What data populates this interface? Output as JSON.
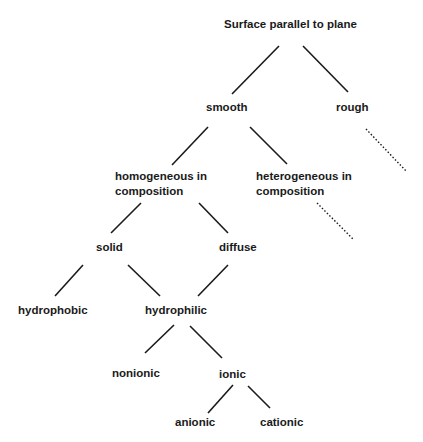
{
  "diagram": {
    "nodes": {
      "root": "Surface parallel to plane",
      "smooth": "smooth",
      "rough": "rough",
      "homogeneous_line1": "homogeneous in",
      "homogeneous_line2": "composition",
      "heterogeneous_line1": "heterogeneous in",
      "heterogeneous_line2": "composition",
      "solid": "solid",
      "diffuse": "diffuse",
      "hydrophobic": "hydrophobic",
      "hydrophilic": "hydrophilic",
      "nonionic": "nonionic",
      "ionic": "ionic",
      "anionic": "anionic",
      "cationic": "cationic"
    },
    "edges": [
      {
        "from": "Surface parallel to plane",
        "to": "smooth",
        "style": "solid"
      },
      {
        "from": "Surface parallel to plane",
        "to": "rough",
        "style": "solid"
      },
      {
        "from": "rough",
        "to": "(unspecified)",
        "style": "dotted"
      },
      {
        "from": "smooth",
        "to": "homogeneous in composition",
        "style": "solid"
      },
      {
        "from": "smooth",
        "to": "heterogeneous in composition",
        "style": "solid"
      },
      {
        "from": "heterogeneous in composition",
        "to": "(unspecified)",
        "style": "dotted"
      },
      {
        "from": "homogeneous in composition",
        "to": "solid",
        "style": "solid"
      },
      {
        "from": "homogeneous in composition",
        "to": "diffuse",
        "style": "solid"
      },
      {
        "from": "solid",
        "to": "hydrophobic",
        "style": "solid"
      },
      {
        "from": "solid",
        "to": "hydrophilic",
        "style": "solid"
      },
      {
        "from": "diffuse",
        "to": "hydrophilic",
        "style": "solid"
      },
      {
        "from": "hydrophilic",
        "to": "nonionic",
        "style": "solid"
      },
      {
        "from": "hydrophilic",
        "to": "ionic",
        "style": "solid"
      },
      {
        "from": "ionic",
        "to": "anionic",
        "style": "solid"
      },
      {
        "from": "ionic",
        "to": "cationic",
        "style": "solid"
      }
    ],
    "colors": {
      "text": "#1a1a1a",
      "lines": "#1a1a1a",
      "background": "#ffffff"
    }
  }
}
